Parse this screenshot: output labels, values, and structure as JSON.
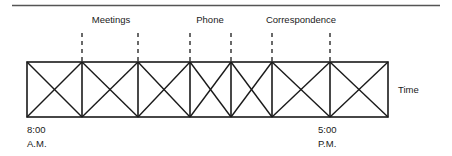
{
  "figure": {
    "type": "time-allocation-block-diagram",
    "axis_label": "Time",
    "start_time_line1": "8:00",
    "start_time_line2": "A.M.",
    "end_time_line1": "5:00",
    "end_time_line2": "P.M.",
    "activities": [
      {
        "label": "Meetings",
        "label_x": 111,
        "start_x": 82,
        "end_x": 138
      },
      {
        "label": "Phone",
        "label_x": 210,
        "start_x": 190,
        "end_x": 231
      },
      {
        "label": "Correspondence",
        "label_x": 301,
        "start_x": 272,
        "end_x": 330
      }
    ],
    "bar": {
      "left": 27,
      "right": 388,
      "top": 62,
      "bottom": 117,
      "dividers": [
        82,
        138,
        190,
        231,
        272,
        330
      ]
    },
    "top_rule": {
      "y": 5,
      "left": 12,
      "right": 440
    },
    "colors": {
      "ink": "#1a1a1a",
      "rule": "#555555",
      "background": "#ffffff"
    }
  }
}
